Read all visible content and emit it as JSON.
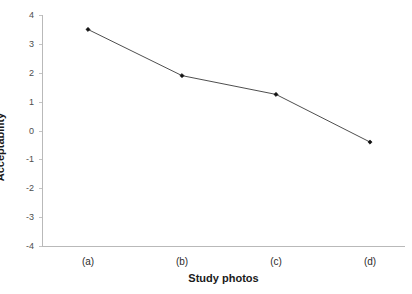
{
  "chart_data": {
    "type": "line",
    "title": "",
    "xlabel": "Study photos",
    "ylabel": "Acceptability",
    "categories": [
      "(a)",
      "(b)",
      "(c)",
      "(d)"
    ],
    "values": [
      3.5,
      1.9,
      1.25,
      -0.4
    ],
    "series": [
      {
        "name": "Acceptability",
        "values": [
          3.5,
          1.9,
          1.25,
          -0.4
        ]
      }
    ],
    "ylim": [
      -4,
      4
    ],
    "yticks": [
      4,
      3,
      2,
      1,
      0,
      -1,
      -2,
      -3,
      -4
    ],
    "ytick_labels": [
      "4",
      "3",
      "2",
      "1",
      "0",
      "-1",
      "-2",
      "-3",
      "-4"
    ],
    "xticks": [
      "(a)",
      "(b)",
      "(c)",
      "(d)"
    ],
    "grid": false,
    "legend": false,
    "legend_position": "none",
    "marker": "diamond",
    "line_color": "#3a3a3a",
    "marker_color": "#111111",
    "axis_color": "#b9b9b9",
    "background_color": "#ffffff"
  }
}
